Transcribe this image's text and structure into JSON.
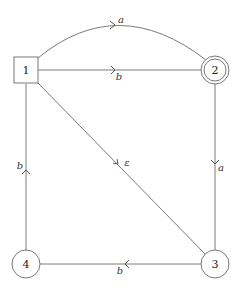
{
  "diagram": {
    "type": "finite-automaton",
    "nodes": [
      {
        "id": "1",
        "label": "1",
        "shape": "square",
        "x": 26,
        "y": 70
      },
      {
        "id": "2",
        "label": "2",
        "shape": "double-circle",
        "x": 215,
        "y": 70
      },
      {
        "id": "3",
        "label": "3",
        "shape": "circle",
        "x": 215,
        "y": 264
      },
      {
        "id": "4",
        "label": "4",
        "shape": "circle",
        "x": 26,
        "y": 264
      }
    ],
    "edges": [
      {
        "from": "1",
        "to": "2",
        "label": "a",
        "style": "curved"
      },
      {
        "from": "1",
        "to": "2",
        "label": "b",
        "style": "straight"
      },
      {
        "from": "1",
        "to": "3",
        "label": "ε",
        "style": "straight"
      },
      {
        "from": "2",
        "to": "3",
        "label": "a",
        "style": "straight"
      },
      {
        "from": "3",
        "to": "4",
        "label": "b",
        "style": "straight"
      },
      {
        "from": "4",
        "to": "1",
        "label": "b",
        "style": "straight"
      }
    ]
  }
}
